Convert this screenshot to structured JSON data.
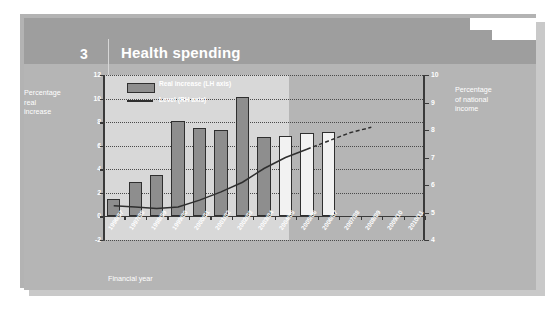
{
  "header": {
    "number": "3",
    "title": "Health spending"
  },
  "axes": {
    "left_title": "Percentage real increase",
    "left_title_lines": [
      "Percentage",
      "real",
      "increase"
    ],
    "right_title": "Percentage of national income",
    "right_title_lines": [
      "Percentage",
      "of national",
      "income"
    ],
    "x_title": "Financial year",
    "left_ticks": [
      "12",
      "10",
      "8",
      "6",
      "4",
      "2",
      "0",
      "-2"
    ],
    "right_ticks": [
      "10",
      "9",
      "8",
      "7",
      "6",
      "5",
      "4"
    ]
  },
  "legend": {
    "bar_label": "Real increase (LH axis)",
    "line_label": "Level (RH axis)"
  },
  "colors": {
    "slide_bg": "#b5b5b5",
    "header_bg": "#9e9e9e",
    "plot_hist_bg": "#d8d8d8",
    "plot_proj_bg": "#b5b5b5",
    "bar_hist": "#8e8e8e",
    "bar_proj": "#f2f2f2",
    "ink": "#2f2f2f",
    "label": "#ffffff"
  },
  "chart_data": {
    "type": "bar",
    "title": "Health spending",
    "xlabel": "Financial year",
    "ylabel": "Percentage real increase",
    "y2label": "Percentage of national income",
    "ylim": [
      -2,
      12
    ],
    "y2lim": [
      4,
      10
    ],
    "grid": true,
    "legend_position": "top-left",
    "categories": [
      "1996/97",
      "1997/98",
      "1998/99",
      "1999/00",
      "2000/01",
      "2001/02",
      "2002/03",
      "2003/04",
      "2004/05",
      "2005/06",
      "2006/07",
      "2007/08",
      "2008/09",
      "2009/10",
      "2010/11"
    ],
    "series": [
      {
        "name": "Real increase (LH axis)",
        "type": "bar",
        "axis": "left",
        "values": [
          1.5,
          2.9,
          3.5,
          8.1,
          7.5,
          7.3,
          10.1,
          6.7,
          6.8,
          7.1,
          7.2,
          null,
          null,
          null,
          null
        ],
        "projected_from_index": 8
      },
      {
        "name": "Level (RH axis)",
        "type": "line",
        "axis": "right",
        "values": [
          5.25,
          5.2,
          5.15,
          5.2,
          5.45,
          5.75,
          6.1,
          6.6,
          7.0,
          7.3,
          7.6,
          7.9,
          8.1,
          null,
          null
        ],
        "dashed_from_index": 9
      }
    ]
  }
}
